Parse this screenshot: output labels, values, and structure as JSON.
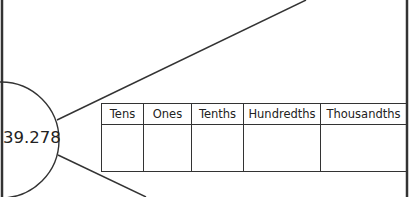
{
  "diagram": {
    "number": "39.278",
    "table": {
      "headers": [
        "Tens",
        "Ones",
        "Tenths",
        "Hundredths",
        "Thousandths"
      ],
      "column_widths": [
        41,
        47,
        51,
        76,
        85
      ],
      "rows": [
        [
          "",
          "",
          "",
          "",
          ""
        ]
      ]
    },
    "colors": {
      "stroke": "#333333",
      "background": "#ffffff",
      "text": "#222222"
    }
  }
}
